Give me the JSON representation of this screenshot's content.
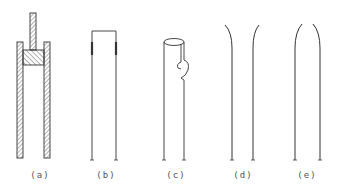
{
  "figure": {
    "panels": [
      {
        "id": "a",
        "label": "(a)",
        "description": "hatched cylinder with piston and rod",
        "label_x": 40
      },
      {
        "id": "b",
        "label": "(b)",
        "description": "two parallel walls joined at top with thickened segments",
        "label_x": 108
      },
      {
        "id": "c",
        "label": "(c)",
        "description": "open-top tube with hook-shaped side slit",
        "label_x": 177
      },
      {
        "id": "d",
        "label": "(d)",
        "description": "two walls flaring outward at top",
        "label_x": 243
      },
      {
        "id": "e",
        "label": "(e)",
        "description": "two walls curving inward at top",
        "label_x": 308
      }
    ],
    "line_color": "#333333",
    "label_y": 170
  }
}
